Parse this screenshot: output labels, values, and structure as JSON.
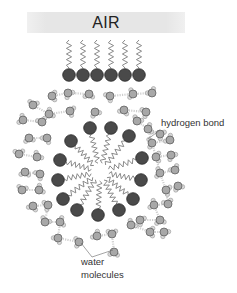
{
  "diagram": {
    "title_banner": "AIR",
    "labels": {
      "hydrogen_bond": "hydrogen bond",
      "water_line1": "water",
      "water_line2": "molecules"
    },
    "colors": {
      "head": "#4a4a4a",
      "head_stroke": "#2a2a2a",
      "chain": "#8a8a8a",
      "oxygen": "#a8a8a8",
      "oxygen_stroke": "#555555",
      "hydrogen": "#d8d8d8",
      "hbond": "#cfcfcf",
      "banner": "#e6e6e6",
      "leader": "#666666"
    },
    "surface_surfactants": {
      "heads_x": [
        69,
        83,
        97,
        111,
        125,
        139
      ],
      "head_y": 75,
      "head_r": 6.3,
      "chain_top_y": 40,
      "chain_bottom_y": 68
    },
    "micelle": {
      "center": [
        100,
        172
      ],
      "core_r": 8,
      "head_r": 6.3,
      "heads": [
        [
          90,
          128
        ],
        [
          111,
          128
        ],
        [
          129,
          136
        ],
        [
          71,
          141
        ],
        [
          142,
          158
        ],
        [
          60,
          160
        ],
        [
          141,
          180
        ],
        [
          58,
          180
        ],
        [
          133,
          199
        ],
        [
          63,
          199
        ],
        [
          119,
          210
        ],
        [
          77,
          210
        ],
        [
          98,
          215
        ]
      ]
    },
    "water_molecules": [
      [
        52,
        96
      ],
      [
        68,
        93
      ],
      [
        89,
        94
      ],
      [
        110,
        96
      ],
      [
        133,
        94
      ],
      [
        152,
        93
      ],
      [
        33,
        105
      ],
      [
        49,
        114
      ],
      [
        70,
        111
      ],
      [
        95,
        112
      ],
      [
        124,
        110
      ],
      [
        146,
        112
      ],
      [
        23,
        120
      ],
      [
        42,
        122
      ],
      [
        137,
        121
      ],
      [
        148,
        129
      ],
      [
        160,
        134
      ],
      [
        29,
        138
      ],
      [
        47,
        138
      ],
      [
        152,
        143
      ],
      [
        170,
        140
      ],
      [
        19,
        154
      ],
      [
        37,
        157
      ],
      [
        156,
        157
      ],
      [
        171,
        155
      ],
      [
        25,
        172
      ],
      [
        40,
        174
      ],
      [
        160,
        173
      ],
      [
        175,
        170
      ],
      [
        22,
        190
      ],
      [
        39,
        190
      ],
      [
        166,
        190
      ],
      [
        178,
        186
      ],
      [
        33,
        206
      ],
      [
        48,
        205
      ],
      [
        154,
        205
      ],
      [
        168,
        204
      ],
      [
        45,
        222
      ],
      [
        60,
        222
      ],
      [
        140,
        220
      ],
      [
        160,
        220
      ],
      [
        58,
        238
      ],
      [
        79,
        242
      ],
      [
        97,
        236
      ],
      [
        112,
        234
      ],
      [
        131,
        225
      ],
      [
        150,
        232
      ],
      [
        164,
        232
      ],
      [
        114,
        252
      ]
    ],
    "hbonds": [
      [
        [
          52,
          96
        ],
        [
          68,
          93
        ]
      ],
      [
        [
          68,
          93
        ],
        [
          89,
          94
        ]
      ],
      [
        [
          110,
          96
        ],
        [
          133,
          94
        ]
      ],
      [
        [
          133,
          94
        ],
        [
          152,
          93
        ]
      ],
      [
        [
          33,
          105
        ],
        [
          49,
          114
        ]
      ],
      [
        [
          49,
          114
        ],
        [
          70,
          111
        ]
      ],
      [
        [
          124,
          110
        ],
        [
          146,
          112
        ]
      ],
      [
        [
          23,
          120
        ],
        [
          42,
          122
        ]
      ],
      [
        [
          42,
          122
        ],
        [
          49,
          114
        ]
      ],
      [
        [
          137,
          121
        ],
        [
          148,
          129
        ]
      ],
      [
        [
          148,
          129
        ],
        [
          160,
          134
        ]
      ],
      [
        [
          29,
          138
        ],
        [
          47,
          138
        ]
      ],
      [
        [
          152,
          143
        ],
        [
          170,
          140
        ]
      ],
      [
        [
          148,
          129
        ],
        [
          152,
          143
        ]
      ],
      [
        [
          19,
          154
        ],
        [
          37,
          157
        ]
      ],
      [
        [
          156,
          157
        ],
        [
          171,
          155
        ]
      ],
      [
        [
          152,
          143
        ],
        [
          156,
          157
        ]
      ],
      [
        [
          25,
          172
        ],
        [
          40,
          174
        ]
      ],
      [
        [
          160,
          173
        ],
        [
          175,
          170
        ]
      ],
      [
        [
          156,
          157
        ],
        [
          160,
          173
        ]
      ],
      [
        [
          22,
          190
        ],
        [
          39,
          190
        ]
      ],
      [
        [
          166,
          190
        ],
        [
          178,
          186
        ]
      ],
      [
        [
          160,
          173
        ],
        [
          166,
          190
        ]
      ],
      [
        [
          33,
          206
        ],
        [
          48,
          205
        ]
      ],
      [
        [
          154,
          205
        ],
        [
          168,
          204
        ]
      ],
      [
        [
          166,
          190
        ],
        [
          168,
          204
        ]
      ],
      [
        [
          45,
          222
        ],
        [
          60,
          222
        ]
      ],
      [
        [
          48,
          205
        ],
        [
          45,
          222
        ]
      ],
      [
        [
          140,
          220
        ],
        [
          160,
          220
        ]
      ],
      [
        [
          154,
          205
        ],
        [
          160,
          220
        ]
      ],
      [
        [
          58,
          238
        ],
        [
          79,
          242
        ]
      ],
      [
        [
          60,
          222
        ],
        [
          58,
          238
        ]
      ],
      [
        [
          97,
          236
        ],
        [
          112,
          234
        ]
      ],
      [
        [
          131,
          225
        ],
        [
          150,
          232
        ]
      ],
      [
        [
          150,
          232
        ],
        [
          164,
          232
        ]
      ],
      [
        [
          112,
          234
        ],
        [
          114,
          252
        ]
      ]
    ],
    "leaders": {
      "hydrogen_bond": [
        [
          160,
          130
        ],
        [
          148,
          139
        ]
      ],
      "water": [
        [
          [
            92,
            257
          ],
          [
            81,
            243
          ]
        ],
        [
          [
            92,
            257
          ],
          [
            113,
            250
          ]
        ]
      ]
    }
  }
}
